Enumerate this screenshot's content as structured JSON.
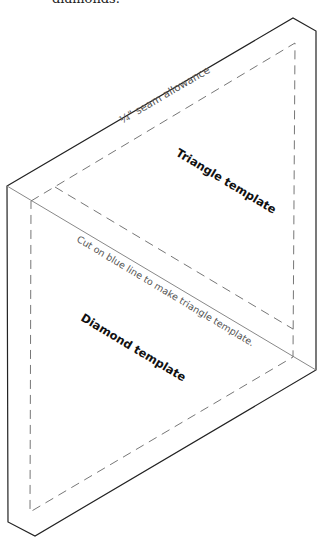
{
  "caption": "diamonds.",
  "diagram": {
    "labels": {
      "seam_allowance": "¼\" seam allowance",
      "triangle": "Triangle template",
      "cut_line": "Cut on blue line to make triangle template.",
      "diamond": "Diamond template"
    },
    "colors": {
      "outline": "#222222",
      "cut_line": "#888888",
      "dashed": "#777777",
      "text": "#111111",
      "muted_text": "#555555"
    }
  }
}
